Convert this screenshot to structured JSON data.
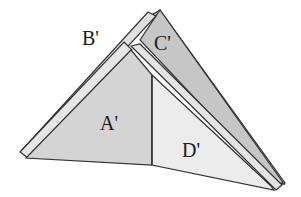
{
  "figure": {
    "labels": {
      "a": "A'",
      "b": "B'",
      "c": "C'",
      "d": "D'"
    },
    "colors": {
      "background": "#ffffff",
      "face_a": "#d4d4d4",
      "face_c": "#c2c2c2",
      "face_d": "#ececec",
      "strip": "#e2e2e2",
      "stroke": "#333333"
    }
  }
}
